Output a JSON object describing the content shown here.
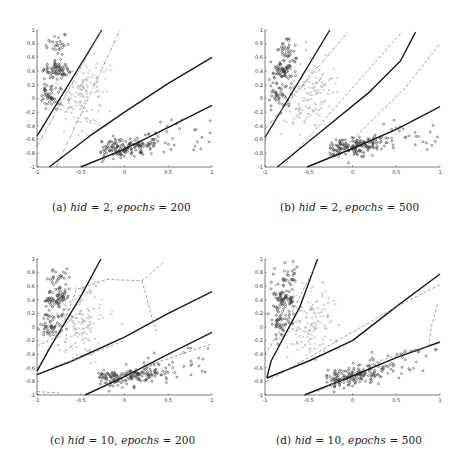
{
  "figure": {
    "panels": [
      {
        "id": "a",
        "caption": {
          "label": "(a)",
          "var1": "hid",
          "val1": "2",
          "var2": "epochs",
          "val2": "200"
        },
        "box": {
          "left": 37,
          "top": 30,
          "right": 212,
          "bottom": 167
        },
        "captionPos": {
          "x": 52,
          "y": 203
        },
        "lines": [
          {
            "style": "solid",
            "width": 1.4,
            "pts": [
              [
                -1,
                -0.55
              ],
              [
                -0.26,
                1.0
              ]
            ]
          },
          {
            "style": "dashdot",
            "width": 0.8,
            "color": "#8a8a8a",
            "pts": [
              [
                -1,
                -0.7
              ],
              [
                -0.27,
                0.98
              ]
            ]
          },
          {
            "style": "dashdot",
            "width": 0.8,
            "color": "#8a8a8a",
            "pts": [
              [
                -0.78,
                -1
              ],
              [
                -0.05,
                1.0
              ]
            ]
          },
          {
            "style": "solid",
            "width": 1.4,
            "pts": [
              [
                -0.86,
                -1
              ],
              [
                -0.4,
                -0.55
              ],
              [
                0,
                -0.2
              ],
              [
                0.5,
                0.22
              ],
              [
                1,
                0.6
              ]
            ]
          },
          {
            "style": "solid",
            "width": 1.4,
            "pts": [
              [
                -0.5,
                -1
              ],
              [
                0,
                -0.74
              ],
              [
                0.5,
                -0.42
              ],
              [
                1,
                -0.1
              ]
            ]
          }
        ]
      },
      {
        "id": "b",
        "caption": {
          "label": "(b)",
          "var1": "hid",
          "val1": "2",
          "var2": "epochs",
          "val2": "500"
        },
        "box": {
          "left": 265,
          "top": 30,
          "right": 440,
          "bottom": 167
        },
        "captionPos": {
          "x": 280,
          "y": 203
        },
        "lines": [
          {
            "style": "solid",
            "width": 1.4,
            "pts": [
              [
                -1,
                -0.57
              ],
              [
                -0.26,
                1.0
              ]
            ]
          },
          {
            "style": "dashdot",
            "width": 0.8,
            "color": "#8a8a8a",
            "pts": [
              [
                -1,
                -0.45
              ],
              [
                -0.05,
                0.97
              ]
            ]
          },
          {
            "style": "dashed",
            "width": 0.8,
            "color": "#8a8a8a",
            "pts": [
              [
                -0.8,
                -1
              ],
              [
                0.55,
                0.95
              ]
            ]
          },
          {
            "style": "solid",
            "width": 1.4,
            "pts": [
              [
                -0.86,
                -1
              ],
              [
                -0.3,
                -0.42
              ],
              [
                0.2,
                0.1
              ],
              [
                0.55,
                0.55
              ],
              [
                0.72,
                0.97
              ]
            ]
          },
          {
            "style": "dashed",
            "width": 0.8,
            "color": "#8a8a8a",
            "pts": [
              [
                -0.2,
                -0.85
              ],
              [
                0.6,
                0.15
              ],
              [
                1,
                0.8
              ]
            ]
          },
          {
            "style": "solid",
            "width": 1.4,
            "pts": [
              [
                -0.52,
                -1
              ],
              [
                0,
                -0.73
              ],
              [
                0.5,
                -0.45
              ],
              [
                1,
                -0.12
              ]
            ]
          }
        ]
      },
      {
        "id": "c",
        "caption": {
          "label": "(c)",
          "var1": "hid",
          "val1": "10",
          "var2": "epochs",
          "val2": "200"
        },
        "box": {
          "left": 37,
          "top": 259,
          "right": 212,
          "bottom": 395
        },
        "captionPos": {
          "x": 50,
          "y": 436
        },
        "lines": [
          {
            "style": "solid",
            "width": 1.4,
            "pts": [
              [
                -1,
                -0.65
              ],
              [
                -0.85,
                -0.3
              ],
              [
                -0.5,
                0.45
              ],
              [
                -0.27,
                1.0
              ]
            ]
          },
          {
            "style": "solid",
            "width": 1.4,
            "pts": [
              [
                -1,
                -0.7
              ],
              [
                -0.6,
                -0.5
              ],
              [
                0,
                -0.15
              ],
              [
                0.5,
                0.2
              ],
              [
                1,
                0.52
              ]
            ]
          },
          {
            "style": "solid",
            "width": 1.4,
            "pts": [
              [
                -0.45,
                -1
              ],
              [
                0,
                -0.73
              ],
              [
                0.5,
                -0.4
              ],
              [
                1,
                -0.08
              ]
            ]
          },
          {
            "style": "dashed",
            "width": 0.8,
            "color": "#8a8a8a",
            "pts": [
              [
                -1,
                -0.28
              ],
              [
                -0.75,
                -0.12
              ],
              [
                -0.55,
                0.55
              ],
              [
                -0.2,
                0.7
              ],
              [
                0.2,
                0.68
              ],
              [
                0.45,
                0.95
              ]
            ]
          },
          {
            "style": "dashed",
            "width": 0.8,
            "color": "#8a8a8a",
            "pts": [
              [
                0.2,
                0.68
              ],
              [
                0.25,
                0.45
              ],
              [
                0.32,
                0.1
              ],
              [
                0.38,
                -0.1
              ]
            ]
          },
          {
            "style": "dashed",
            "width": 0.8,
            "color": "#8a8a8a",
            "pts": [
              [
                -0.8,
                -0.58
              ],
              [
                -0.5,
                -0.45
              ],
              [
                0,
                -0.2
              ]
            ]
          },
          {
            "style": "dashed",
            "width": 0.8,
            "color": "#8a8a8a",
            "pts": [
              [
                0.3,
                -0.55
              ],
              [
                0.65,
                -0.4
              ],
              [
                1,
                -0.25
              ]
            ]
          },
          {
            "style": "dashed",
            "width": 0.8,
            "color": "#8a8a8a",
            "pts": [
              [
                -1,
                -0.95
              ],
              [
                -0.75,
                -0.97
              ]
            ]
          }
        ]
      },
      {
        "id": "d",
        "caption": {
          "label": "(d)",
          "var1": "hid",
          "val1": "10",
          "var2": "epochs",
          "val2": "500"
        },
        "box": {
          "left": 265,
          "top": 259,
          "right": 440,
          "bottom": 395
        },
        "captionPos": {
          "x": 276,
          "y": 436
        },
        "lines": [
          {
            "style": "solid",
            "width": 1.4,
            "pts": [
              [
                -0.98,
                -0.75
              ],
              [
                -0.93,
                -0.5
              ],
              [
                -0.6,
                0.3
              ],
              [
                -0.4,
                1.0
              ]
            ]
          },
          {
            "style": "solid",
            "width": 1.4,
            "pts": [
              [
                -0.98,
                -0.75
              ],
              [
                -0.5,
                -0.5
              ],
              [
                0,
                -0.2
              ],
              [
                0.5,
                0.3
              ],
              [
                1,
                0.78
              ]
            ]
          },
          {
            "style": "solid",
            "width": 1.4,
            "pts": [
              [
                -0.55,
                -1
              ],
              [
                0,
                -0.72
              ],
              [
                0.5,
                -0.45
              ],
              [
                1,
                -0.22
              ]
            ]
          },
          {
            "style": "dashed",
            "width": 0.8,
            "color": "#8a8a8a",
            "pts": [
              [
                -1,
                -0.4
              ],
              [
                -0.7,
                0.2
              ],
              [
                -0.4,
                0.95
              ]
            ]
          },
          {
            "style": "dashed",
            "width": 0.8,
            "color": "#8a8a8a",
            "pts": [
              [
                -0.98,
                -0.8
              ],
              [
                -0.3,
                -0.3
              ],
              [
                0.5,
                0.3
              ],
              [
                1,
                0.62
              ]
            ]
          },
          {
            "style": "dashed",
            "width": 0.8,
            "color": "#8a8a8a",
            "pts": [
              [
                -0.4,
                -0.95
              ],
              [
                0.3,
                -0.5
              ],
              [
                0.87,
                -0.28
              ],
              [
                0.9,
                0.0
              ],
              [
                0.97,
                0.33
              ]
            ]
          }
        ]
      }
    ]
  },
  "chart_data": [
    {
      "type": "scatter",
      "title": "(a) hid = 2, epochs = 200",
      "xlabel": "",
      "ylabel": "",
      "xlim": [
        -1,
        1
      ],
      "ylim": [
        -1,
        1
      ],
      "xticks": [
        "-1",
        "-0.5",
        "0",
        "0.5",
        "1"
      ],
      "yticks": [
        "-1",
        "-0.8",
        "-0.6",
        "-0.4",
        "-0.2",
        "0",
        "0.2",
        "0.4",
        "0.6",
        "0.8",
        "1"
      ],
      "series": [
        {
          "name": "class 1 (dark circles, upper-left)",
          "center": [
            -0.8,
            0.35
          ],
          "spread": [
            0.1,
            0.3
          ]
        },
        {
          "name": "class 2 (light crosses, middle)",
          "center": [
            -0.45,
            0.05
          ],
          "spread": [
            0.15,
            0.3
          ]
        },
        {
          "name": "class 3 (dark circles, lower-right)",
          "center": [
            0.05,
            -0.7
          ],
          "spread": [
            0.3,
            0.12
          ]
        }
      ],
      "boundaries": "solid black network boundaries + grey dash-dot optimal boundaries"
    },
    {
      "type": "scatter",
      "title": "(b) hid = 2, epochs = 500",
      "xlim": [
        -1,
        1
      ],
      "ylim": [
        -1,
        1
      ],
      "xticks": [
        "-1",
        "-0.5",
        "0",
        "0.5",
        "1"
      ],
      "yticks": [
        "-1",
        "-0.8",
        "-0.6",
        "-0.4",
        "-0.2",
        "0",
        "0.2",
        "0.4",
        "0.6",
        "0.8",
        "1"
      ],
      "series": [
        {
          "name": "class 1",
          "center": [
            -0.8,
            0.35
          ]
        },
        {
          "name": "class 2",
          "center": [
            -0.45,
            0.05
          ]
        },
        {
          "name": "class 3",
          "center": [
            0.05,
            -0.7
          ]
        }
      ]
    },
    {
      "type": "scatter",
      "title": "(c) hid = 10, epochs = 200",
      "xlim": [
        -1,
        1
      ],
      "ylim": [
        -1,
        1
      ],
      "xticks": [
        "-1",
        "-0.5",
        "0",
        "0.5",
        "1"
      ],
      "yticks": [
        "-1",
        "-0.8",
        "-0.6",
        "-0.4",
        "-0.2",
        "0",
        "0.2",
        "0.4",
        "0.6",
        "0.8",
        "1"
      ],
      "series": [
        {
          "name": "class 1",
          "center": [
            -0.8,
            0.35
          ]
        },
        {
          "name": "class 2",
          "center": [
            -0.45,
            0.05
          ]
        },
        {
          "name": "class 3",
          "center": [
            0.05,
            -0.7
          ]
        }
      ]
    },
    {
      "type": "scatter",
      "title": "(d) hid = 10, epochs = 500",
      "xlim": [
        -1,
        1
      ],
      "ylim": [
        -1,
        1
      ],
      "xticks": [
        "-1",
        "-0.5",
        "0",
        "0.5",
        "1"
      ],
      "yticks": [
        "-1",
        "-0.8",
        "-0.6",
        "-0.4",
        "-0.2",
        "0",
        "0.2",
        "0.4",
        "0.6",
        "0.8",
        "1"
      ],
      "series": [
        {
          "name": "class 1",
          "center": [
            -0.8,
            0.35
          ]
        },
        {
          "name": "class 2",
          "center": [
            -0.45,
            0.05
          ]
        },
        {
          "name": "class 3",
          "center": [
            0.05,
            -0.7
          ]
        }
      ]
    }
  ],
  "axes": {
    "xticks": [
      {
        "v": -1,
        "t": "-1"
      },
      {
        "v": -0.5,
        "t": "-0.5"
      },
      {
        "v": 0,
        "t": "0"
      },
      {
        "v": 0.5,
        "t": "0.5"
      },
      {
        "v": 1,
        "t": "1"
      }
    ],
    "yticks": [
      {
        "v": -1,
        "t": "-1"
      },
      {
        "v": -0.8,
        "t": "-0.8"
      },
      {
        "v": -0.6,
        "t": "-0.6"
      },
      {
        "v": -0.4,
        "t": "-0.4"
      },
      {
        "v": -0.2,
        "t": "-0.2"
      },
      {
        "v": 0,
        "t": "0"
      },
      {
        "v": 0.2,
        "t": "0.2"
      },
      {
        "v": 0.4,
        "t": "0.4"
      },
      {
        "v": 0.6,
        "t": "0.6"
      },
      {
        "v": 0.8,
        "t": "0.8"
      },
      {
        "v": 1,
        "t": "1"
      }
    ]
  },
  "colors": {
    "dark": "#3a3a3a",
    "light": "#a8a8a8",
    "axis": "#444444"
  }
}
